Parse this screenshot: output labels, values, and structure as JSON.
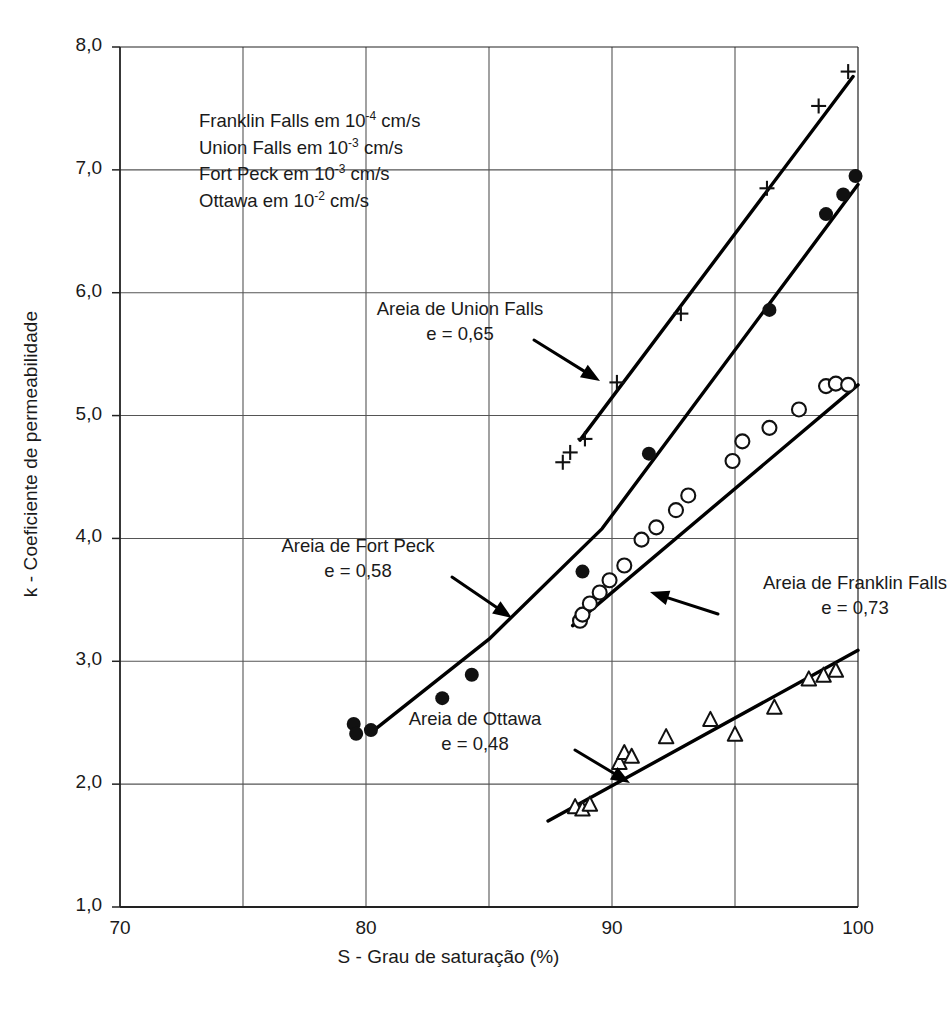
{
  "chart_data": {
    "type": "scatter",
    "title": "",
    "xlabel": "S - Grau de saturação (%)",
    "ylabel": "k - Coeficiente de permeabilidade",
    "xlim": [
      70,
      100
    ],
    "ylim": [
      1.0,
      8.0
    ],
    "xticks": [
      70,
      80,
      90,
      100
    ],
    "xtick_labels": [
      "70",
      "80",
      "90",
      "100"
    ],
    "x_gridlines": [
      70,
      75,
      80,
      85,
      90,
      95,
      100
    ],
    "yticks": [
      1.0,
      2.0,
      3.0,
      4.0,
      5.0,
      6.0,
      7.0,
      8.0
    ],
    "ytick_labels": [
      "1,0",
      "2,0",
      "3,0",
      "4,0",
      "5,0",
      "6,0",
      "7,0",
      "8,0"
    ],
    "grid": true,
    "legend_position": "upper-left-inside",
    "units_note": [
      {
        "name": "Franklin Falls",
        "text_prefix": "Franklin Falls em 10",
        "exponent": "-4",
        "text_suffix": " cm/s"
      },
      {
        "name": "Union Falls",
        "text_prefix": "Union Falls em 10",
        "exponent": "-3",
        "text_suffix": " cm/s"
      },
      {
        "name": "Fort Peck",
        "text_prefix": "Fort Peck em 10",
        "exponent": "-3",
        "text_suffix": " cm/s"
      },
      {
        "name": "Ottawa",
        "text_prefix": "Ottawa em 10",
        "exponent": "-2",
        "text_suffix": " cm/s"
      }
    ],
    "series": [
      {
        "name": "Areia de Union Falls",
        "marker": "plus",
        "void_ratio_label": "e = 0,65",
        "points": [
          [
            88.0,
            4.62
          ],
          [
            88.3,
            4.7
          ],
          [
            88.9,
            4.81
          ],
          [
            90.2,
            5.27
          ],
          [
            92.8,
            5.83
          ],
          [
            96.3,
            6.85
          ],
          [
            98.4,
            7.52
          ],
          [
            99.6,
            7.8
          ]
        ],
        "trend_line": [
          [
            88.7,
            4.8
          ],
          [
            99.8,
            7.76
          ]
        ]
      },
      {
        "name": "Areia de Fort Peck",
        "marker": "filled-circle",
        "void_ratio_label": "e = 0,58",
        "points": [
          [
            79.5,
            2.49
          ],
          [
            79.6,
            2.41
          ],
          [
            80.2,
            2.44
          ],
          [
            83.1,
            2.7
          ],
          [
            84.3,
            2.89
          ],
          [
            88.8,
            3.73
          ],
          [
            91.5,
            4.69
          ],
          [
            96.4,
            5.86
          ],
          [
            98.7,
            6.64
          ],
          [
            99.4,
            6.8
          ],
          [
            99.9,
            6.95
          ]
        ],
        "trend_line": [
          [
            80.2,
            2.42
          ],
          [
            85.0,
            3.18
          ],
          [
            89.6,
            4.08
          ],
          [
            100.0,
            6.88
          ]
        ]
      },
      {
        "name": "Areia de Franklin Falls",
        "marker": "open-circle",
        "void_ratio_label": "e = 0,73",
        "points": [
          [
            88.7,
            3.33
          ],
          [
            88.8,
            3.38
          ],
          [
            89.1,
            3.47
          ],
          [
            89.5,
            3.56
          ],
          [
            89.9,
            3.66
          ],
          [
            90.5,
            3.78
          ],
          [
            91.2,
            3.99
          ],
          [
            91.8,
            4.09
          ],
          [
            92.6,
            4.23
          ],
          [
            93.1,
            4.35
          ],
          [
            94.9,
            4.63
          ],
          [
            95.3,
            4.79
          ],
          [
            96.4,
            4.9
          ],
          [
            97.6,
            5.05
          ],
          [
            98.7,
            5.24
          ],
          [
            99.1,
            5.26
          ],
          [
            99.6,
            5.25
          ]
        ],
        "trend_line": [
          [
            88.4,
            3.29
          ],
          [
            100.0,
            5.25
          ]
        ]
      },
      {
        "name": "Areia de Ottawa",
        "marker": "open-triangle",
        "void_ratio_label": "e = 0,48",
        "points": [
          [
            88.5,
            1.81
          ],
          [
            88.8,
            1.79
          ],
          [
            89.1,
            1.83
          ],
          [
            90.3,
            2.17
          ],
          [
            90.5,
            2.25
          ],
          [
            90.8,
            2.22
          ],
          [
            92.2,
            2.38
          ],
          [
            94.0,
            2.52
          ],
          [
            95.0,
            2.4
          ],
          [
            96.6,
            2.62
          ],
          [
            98.0,
            2.85
          ],
          [
            98.6,
            2.88
          ],
          [
            99.1,
            2.92
          ]
        ],
        "trend_line": [
          [
            87.4,
            1.7
          ],
          [
            100.0,
            3.09
          ]
        ]
      }
    ],
    "annotations": [
      {
        "id": "union-falls",
        "line1": "Areia de Union Falls",
        "line2": "e = 0,65",
        "arrow_from": [
          534,
          340
        ],
        "arrow_to": [
          600,
          381
        ]
      },
      {
        "id": "fort-peck",
        "line1": "Areia de Fort Peck",
        "line2": "e = 0,58",
        "arrow_from": [
          452,
          577
        ],
        "arrow_to": [
          512,
          618
        ]
      },
      {
        "id": "franklin-falls",
        "line1": "Areia de Franklin Falls",
        "line2": "e = 0,73",
        "arrow_from": [
          718,
          614
        ],
        "arrow_to": [
          650,
          592
        ]
      },
      {
        "id": "ottawa",
        "line1": "Areia de Ottawa",
        "line2": "e = 0,48",
        "arrow_from": [
          575,
          750
        ],
        "arrow_to": [
          630,
          783
        ]
      }
    ],
    "colors": {
      "axis": "#222222",
      "grid": "#555555",
      "marker": "#111111",
      "trend": "#000000",
      "text": "#1a1a1a",
      "background": "#ffffff"
    }
  }
}
